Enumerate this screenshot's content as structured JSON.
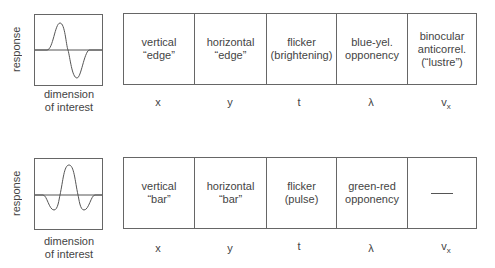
{
  "rows": [
    {
      "id": "edge",
      "y_axis_label": "response",
      "x_axis_label": "dimension\nof interest",
      "profile": "odd-symmetric",
      "cells": [
        {
          "label": "vertical\n“edge”",
          "dimension": "x"
        },
        {
          "label": "horizontal\n“edge”",
          "dimension": "y"
        },
        {
          "label": "flicker\n(brightening)",
          "dimension": "t"
        },
        {
          "label": "blue-yel.\nopponency",
          "dimension": "λ"
        },
        {
          "label": "binocular\nanticorrel.\n(“lustre”)",
          "dimension": "v",
          "dimension_sub": "x"
        }
      ]
    },
    {
      "id": "bar",
      "y_axis_label": "response",
      "x_axis_label": "dimension\nof interest",
      "profile": "even-symmetric",
      "cells": [
        {
          "label": "vertical\n“bar”",
          "dimension": "x"
        },
        {
          "label": "horizontal\n“bar”",
          "dimension": "y"
        },
        {
          "label": "flicker\n(pulse)",
          "dimension": "t"
        },
        {
          "label": "green-red\nopponency",
          "dimension": "λ"
        },
        {
          "label": "—",
          "dimension": "v",
          "dimension_sub": "x"
        }
      ]
    }
  ]
}
